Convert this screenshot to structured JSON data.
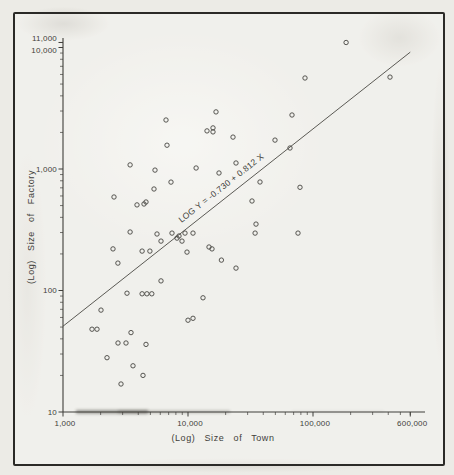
{
  "figure": {
    "bg": "#ecebe6",
    "frame_color": "#2b2a27",
    "ink": "#3f3e3a",
    "point_color": "#454440"
  },
  "chart_data": {
    "type": "scatter",
    "title": "",
    "grid": false,
    "legend": null,
    "x_axis": {
      "label": "(Log)  Size  of  Town",
      "scale": "log",
      "range": [
        1000,
        600000
      ],
      "tick_values": [
        1000,
        10000,
        100000,
        600000
      ],
      "tick_labels": [
        "1,000",
        "10,000",
        "100,000",
        "600,000"
      ]
    },
    "y_axis": {
      "label": "(Log) Size of Factory",
      "scale": "log",
      "range": [
        10,
        11000
      ],
      "tick_values": [
        11000,
        10000,
        1000,
        100,
        10
      ],
      "tick_labels": [
        "11,000",
        "10,000",
        "1,000",
        "100",
        "10"
      ]
    },
    "regression": {
      "label": "LOG Y = -0.730 + 0.812 X",
      "intercept": -0.73,
      "slope": 0.812,
      "x_start": 1000,
      "x_end": 600000
    },
    "points": [
      [
        6670,
        2530
      ],
      [
        6790,
        1570
      ],
      [
        3440,
        1080
      ],
      [
        5450,
        980
      ],
      [
        7310,
        780
      ],
      [
        5350,
        684
      ],
      [
        2560,
        588
      ],
      [
        4610,
        535
      ],
      [
        16750,
        2950
      ],
      [
        14200,
        2060
      ],
      [
        15850,
        2180
      ],
      [
        15850,
        2020
      ],
      [
        22900,
        1830
      ],
      [
        67900,
        2780
      ],
      [
        184000,
        11000
      ],
      [
        413000,
        5710
      ],
      [
        86300,
        5610
      ],
      [
        49700,
        1730
      ],
      [
        65500,
        1490
      ],
      [
        24200,
        1120
      ],
      [
        11600,
        1020
      ],
      [
        17700,
        927
      ],
      [
        37700,
        782
      ],
      [
        78700,
        707
      ],
      [
        32500,
        545
      ],
      [
        35000,
        352
      ],
      [
        34400,
        297
      ],
      [
        75900,
        297
      ],
      [
        15560,
        220
      ],
      [
        18500,
        178
      ],
      [
        24200,
        153
      ],
      [
        13180,
        87
      ],
      [
        3910,
        506
      ],
      [
        4450,
        515
      ],
      [
        3440,
        303
      ],
      [
        2510,
        220
      ],
      [
        2750,
        168
      ],
      [
        6080,
        120
      ],
      [
        3250,
        95
      ],
      [
        4290,
        94
      ],
      [
        4690,
        94
      ],
      [
        5130,
        94
      ],
      [
        5650,
        292
      ],
      [
        6080,
        255
      ],
      [
        7450,
        297
      ],
      [
        8170,
        270
      ],
      [
        8470,
        281
      ],
      [
        8950,
        255
      ],
      [
        9460,
        297
      ],
      [
        10960,
        297
      ],
      [
        9820,
        207
      ],
      [
        14720,
        228
      ],
      [
        4960,
        211
      ],
      [
        4290,
        211
      ],
      [
        2015,
        69
      ],
      [
        1705,
        48
      ],
      [
        1870,
        48
      ],
      [
        3500,
        45
      ],
      [
        2755,
        37
      ],
      [
        3190,
        37
      ],
      [
        4615,
        36
      ],
      [
        2250,
        28
      ],
      [
        3630,
        24
      ],
      [
        4365,
        20
      ],
      [
        2910,
        17
      ],
      [
        10000,
        57
      ],
      [
        10960,
        59
      ]
    ]
  }
}
